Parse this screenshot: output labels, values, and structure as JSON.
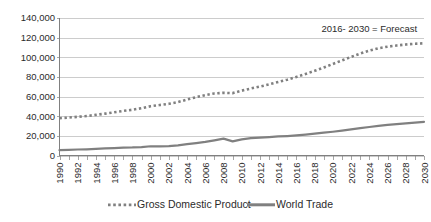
{
  "chart_data": {
    "type": "line",
    "title": "",
    "subtitle": "",
    "xlabel": "",
    "ylabel": "",
    "grid": "horizontal",
    "legend_position": "bottom",
    "xlim": [
      1990,
      2030
    ],
    "ylim": [
      0,
      140000
    ],
    "y_ticks": [
      0,
      20000,
      40000,
      60000,
      80000,
      100000,
      120000,
      140000
    ],
    "y_tick_labels": [
      "0",
      "20,000",
      "40,000",
      "60,000",
      "80,000",
      "100,000",
      "120,000",
      "140,000"
    ],
    "x": [
      1990,
      1991,
      1992,
      1993,
      1994,
      1995,
      1996,
      1997,
      1998,
      1999,
      2000,
      2001,
      2002,
      2003,
      2004,
      2005,
      2006,
      2007,
      2008,
      2009,
      2010,
      2011,
      2012,
      2013,
      2014,
      2015,
      2016,
      2017,
      2018,
      2019,
      2020,
      2021,
      2022,
      2023,
      2024,
      2025,
      2026,
      2027,
      2028,
      2029,
      2030
    ],
    "x_tick_labels": [
      "1990",
      "1992",
      "1994",
      "1996",
      "1998",
      "2000",
      "2002",
      "2004",
      "2006",
      "2008",
      "2010",
      "2012",
      "2014",
      "2016",
      "2018",
      "2020",
      "2022",
      "2024",
      "2026",
      "2028",
      "2030"
    ],
    "annotations": [
      {
        "text": "2016- 2030 = Forecast",
        "x": 2024,
        "y": 126000
      }
    ],
    "series": [
      {
        "name": "Gross Domestic Product",
        "style": "dotted",
        "color": "#808080",
        "values": [
          38000,
          38600,
          39400,
          40200,
          41400,
          42600,
          44000,
          45400,
          46600,
          48200,
          50200,
          51400,
          52600,
          54400,
          57000,
          59400,
          61500,
          63200,
          63800,
          63500,
          66000,
          68200,
          70200,
          72400,
          74800,
          77200,
          80000,
          83000,
          86200,
          89600,
          93200,
          96800,
          100400,
          103800,
          106800,
          109200,
          110800,
          112000,
          113000,
          113800,
          114200
        ]
      },
      {
        "name": "World Trade",
        "style": "solid",
        "color": "#808080",
        "values": [
          5500,
          5800,
          6100,
          6300,
          6700,
          7200,
          7600,
          8000,
          8200,
          8600,
          9400,
          9300,
          9600,
          10400,
          11600,
          12600,
          13800,
          15400,
          17200,
          14400,
          16400,
          17600,
          18200,
          18800,
          19400,
          19800,
          20400,
          21200,
          22200,
          23200,
          24200,
          25400,
          26600,
          27800,
          29000,
          30200,
          31200,
          32000,
          32800,
          33500,
          34200
        ]
      }
    ]
  },
  "legend": {
    "items": [
      {
        "label": "Gross Domestic Product",
        "marker": "dotted-line-swatch"
      },
      {
        "label": "World Trade",
        "marker": "solid-line-swatch"
      }
    ]
  },
  "colors": {
    "series_gray": "#808080",
    "gridline": "#b7b7b7",
    "text": "#2b2b2b",
    "background": "#ffffff"
  }
}
